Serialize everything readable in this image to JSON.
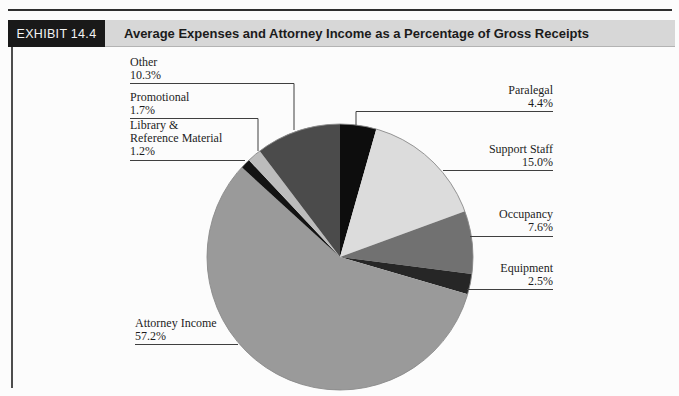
{
  "header": {
    "exhibit_label": "EXHIBIT 14.4",
    "title": "Average Expenses and Attorney Income as a Percentage of Gross Receipts"
  },
  "chart_data": {
    "type": "pie",
    "title": "Average Expenses and Attorney Income as a Percentage of Gross Receipts",
    "start_angle_deg": 0,
    "direction": "clockwise",
    "legend_position": "callout-labels",
    "categories": [
      "Paralegal",
      "Support Staff",
      "Occupancy",
      "Equipment",
      "Attorney Income",
      "Library & Reference Material",
      "Promotional",
      "Other"
    ],
    "values": [
      4.4,
      15.0,
      7.6,
      2.5,
      57.2,
      1.2,
      1.7,
      10.3
    ],
    "slices": [
      {
        "id": "paralegal",
        "label": "Paralegal",
        "value": 4.4,
        "pct": "4.4%",
        "color": "#0d0d0d"
      },
      {
        "id": "support-staff",
        "label": "Support Staff",
        "value": 15.0,
        "pct": "15.0%",
        "color": "#dcdcdc"
      },
      {
        "id": "occupancy",
        "label": "Occupancy",
        "value": 7.6,
        "pct": "7.6%",
        "color": "#717171"
      },
      {
        "id": "equipment",
        "label": "Equipment",
        "value": 2.5,
        "pct": "2.5%",
        "color": "#262626"
      },
      {
        "id": "attorney-income",
        "label": "Attorney Income",
        "value": 57.2,
        "pct": "57.2%",
        "color": "#9a9a9a"
      },
      {
        "id": "library",
        "label": "Library & Reference Material",
        "label_line1": "Library &",
        "label_line2": "Reference Material",
        "value": 1.2,
        "pct": "1.2%",
        "color": "#131313"
      },
      {
        "id": "promotional",
        "label": "Promotional",
        "value": 1.7,
        "pct": "1.7%",
        "color": "#bcbcbc"
      },
      {
        "id": "other",
        "label": "Other",
        "value": 10.3,
        "pct": "10.3%",
        "color": "#4b4b4b"
      }
    ],
    "colors": {
      "outline": "#8a8a8a",
      "leader_line": "#3f3f3f",
      "header_bar_bg": "#d7d7d7",
      "exhibit_tag_bg": "#191919",
      "exhibit_tag_text": "#f4f4f4"
    }
  }
}
